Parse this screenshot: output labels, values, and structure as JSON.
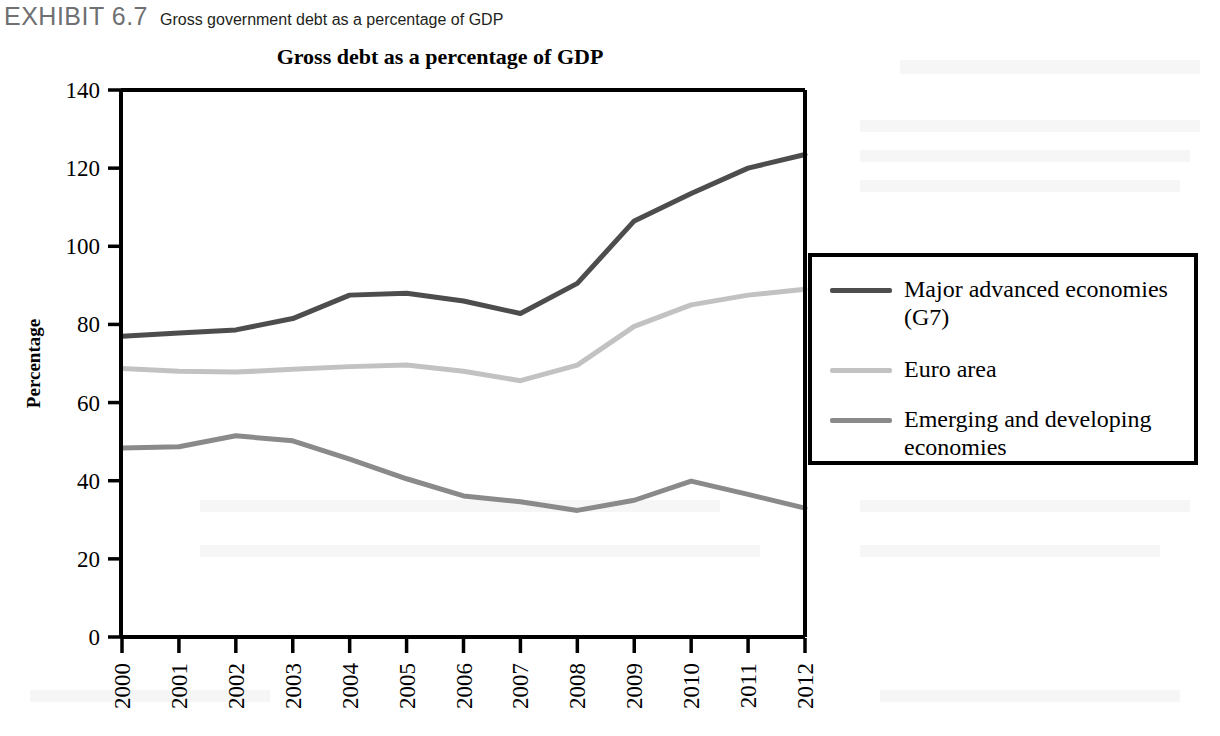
{
  "exhibit": {
    "label": "EXHIBIT 6.7",
    "caption": "Gross government debt as a percentage of GDP"
  },
  "chart_data": {
    "type": "line",
    "title": "Gross debt as a percentage of GDP",
    "xlabel": "",
    "ylabel": "Percentage",
    "categories": [
      "2000",
      "2001",
      "2002",
      "2003",
      "2004",
      "2005",
      "2006",
      "2007",
      "2008",
      "2009",
      "2010",
      "2011",
      "2012"
    ],
    "x": [
      2000,
      2001,
      2002,
      2003,
      2004,
      2005,
      2006,
      2007,
      2008,
      2009,
      2010,
      2011,
      2012
    ],
    "ylim": [
      0,
      140
    ],
    "yticks": [
      0,
      20,
      40,
      60,
      80,
      100,
      120,
      140
    ],
    "grid": false,
    "legend_position": "right",
    "series": [
      {
        "name": "Major advanced economies (G7)",
        "color": "#4d4d4d",
        "values": [
          77.0,
          77.8,
          78.6,
          81.5,
          87.5,
          88.0,
          86.0,
          82.8,
          90.5,
          106.5,
          113.5,
          120.0,
          123.5
        ]
      },
      {
        "name": "Euro area",
        "color": "#c2c2c2",
        "values": [
          68.7,
          68.0,
          67.8,
          68.5,
          69.2,
          69.6,
          68.0,
          65.6,
          69.6,
          79.5,
          85.0,
          87.5,
          89.0
        ]
      },
      {
        "name": "Emerging and developing economies",
        "color": "#8a8a8a",
        "values": [
          48.4,
          48.7,
          51.5,
          50.2,
          45.5,
          40.5,
          36.1,
          34.6,
          32.4,
          35.0,
          39.9,
          36.5,
          33.0
        ]
      }
    ]
  },
  "legend": {
    "entries": [
      {
        "label": "Major advanced economies (G7)",
        "line1": "Major advanced economies",
        "line2": "(G7)",
        "color": "#4d4d4d"
      },
      {
        "label": "Euro area",
        "line1": "Euro area",
        "line2": "",
        "color": "#c2c2c2"
      },
      {
        "label": "Emerging and developing economies",
        "line1": "Emerging and developing",
        "line2": "economies",
        "color": "#8a8a8a"
      }
    ]
  }
}
